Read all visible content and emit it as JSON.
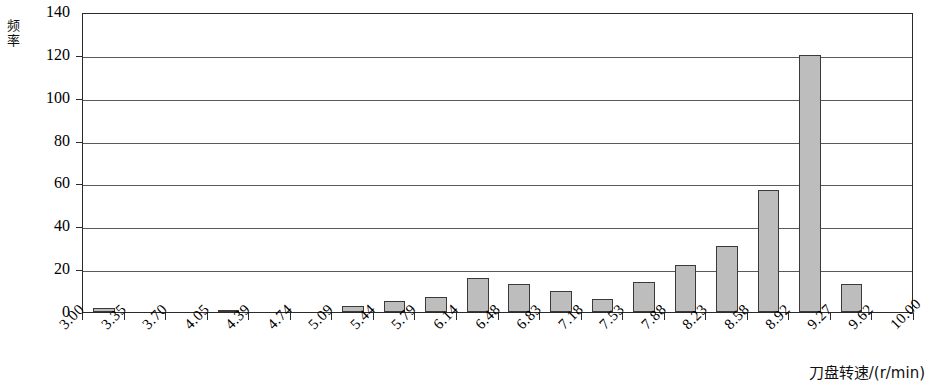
{
  "chart_data": {
    "type": "bar",
    "title": "",
    "subtitle": "",
    "xlabel": "刀盘转速/(r/min)",
    "ylabel": "频率",
    "ylim": [
      0,
      140
    ],
    "ytick_values": [
      0,
      20,
      40,
      60,
      80,
      100,
      120,
      140
    ],
    "ytick_labels": [
      "0",
      "20",
      "40",
      "60",
      "80",
      "100",
      "120",
      "140"
    ],
    "grid": "horizontal",
    "legend": "none",
    "bin_edges": [
      "3.00",
      "3.35",
      "3.70",
      "4.05",
      "4.39",
      "4.74",
      "5.09",
      "5.44",
      "5.79",
      "6.14",
      "6.48",
      "6.83",
      "7.18",
      "7.53",
      "7.88",
      "8.23",
      "8.58",
      "8.92",
      "9.27",
      "9.62",
      "10.00"
    ],
    "categories": [
      "3.00-3.35",
      "3.35-3.70",
      "3.70-4.05",
      "4.05-4.39",
      "4.39-4.74",
      "4.74-5.09",
      "5.09-5.44",
      "5.44-5.79",
      "5.79-6.14",
      "6.14-6.48",
      "6.48-6.83",
      "6.83-7.18",
      "7.18-7.53",
      "7.53-7.88",
      "7.88-8.23",
      "8.23-8.58",
      "8.58-8.92",
      "8.92-9.27",
      "9.27-9.62",
      "9.62-10.00"
    ],
    "values": [
      2,
      0,
      0,
      1,
      0,
      0,
      3,
      5,
      7,
      16,
      13,
      10,
      6,
      14,
      22,
      31,
      57,
      120,
      13,
      0
    ],
    "bar_fill_color": "#bdbdbd",
    "bar_edge_color": "#3a3a3a",
    "axis_color": "#2b2b2b",
    "grid_color": "#5a5a5a"
  }
}
